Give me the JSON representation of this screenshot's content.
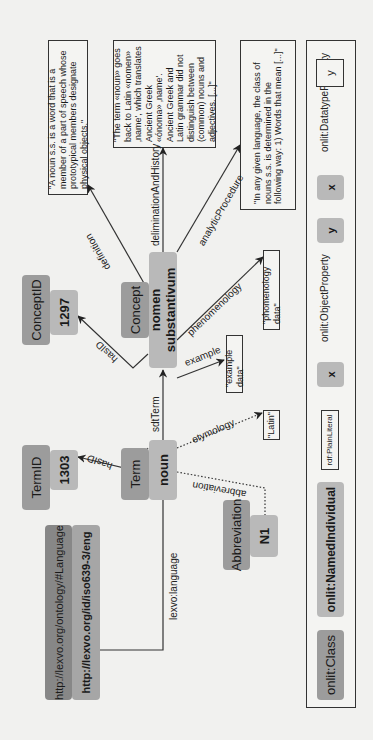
{
  "diagram": {
    "orientation": "rotated-90-ccw",
    "nodes": {
      "concept_class": "Concept",
      "concept_individual": "nomen substantivum",
      "conceptid_class": "ConceptID",
      "conceptid_value": "1297",
      "term_class": "Term",
      "term_individual": "noun",
      "termid_class": "TermID",
      "termid_value": "1303",
      "language_class": "http://lexvo.org/ontology/#Language",
      "language_individual": "http://lexvo.org/id/iso639-3/eng",
      "abbreviation_class": "Abbreviation",
      "abbreviation_individual": "N1"
    },
    "literals": {
      "definition": "\"A noun s.s. is a word that is a member of a part of speech whose prototypical members designate physical objects.\"",
      "delimination": "\"The term «noun» goes back to Latin «nomen» ‚name', which translates Ancient Greek «ónoma» ‚name'. Ancient Greek and Latin grammar did not distinguish between (common) nouns and adjectives. [...]\"",
      "analytic": "\"In any given language, the class of nouns s.s. is determined in the following way: 1) Words that mean [...]\"",
      "phenomenology": "\"phomenology data\"",
      "example": "\"example data\"",
      "etymology": "\"Latin\""
    },
    "edges": {
      "definition": "definition",
      "delimination": "deliminationAndHistory",
      "analytic": "analyticProcedure",
      "phenomenology": "phenomenology",
      "example": "example",
      "hasid_concept": "hasID",
      "sdtterm": "sdtTerm",
      "hasid_term": "hasID",
      "etymology": "etymology",
      "abbreviation": "abbreviation",
      "language": "lexvo:language"
    }
  },
  "legend": {
    "class_label": "onlit:Class",
    "individual_label": "onlit:NamedIndividual",
    "literal_label": "rdf:PlainLiteral",
    "object_property": {
      "label": "onlit:ObjectProperty",
      "from": "x",
      "to": "y"
    },
    "datatype_property": {
      "label": "onlit:DatatypeProperty",
      "from": "x",
      "to": "y"
    }
  },
  "colors": {
    "background": "#f1f1ef",
    "class_fill": "#9c9c9c",
    "individual_fill": "#b9b9b9",
    "external_class_fill": "#878787",
    "external_individual_fill": "#a6a6a6",
    "edge": "#333333"
  }
}
